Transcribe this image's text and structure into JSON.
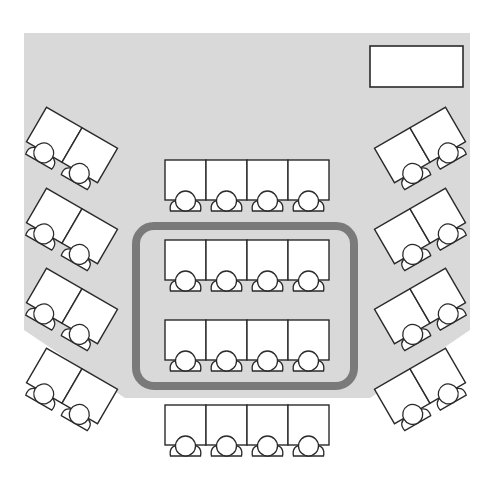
{
  "diagram": {
    "type": "classroom-seating-layout",
    "colors": {
      "room_fill": "#d9d9d9",
      "highlight_stroke": "#7a7a7a",
      "desk_fill": "#ffffff",
      "outline": "#2a2a2a"
    },
    "teacher_desk": {
      "x": 370,
      "y": 46,
      "w": 93,
      "h": 41
    },
    "highlight_group": {
      "x": 136,
      "y": 226,
      "w": 218,
      "h": 160,
      "rx": 18,
      "label": ""
    },
    "center_rows": [
      {
        "name": "row-1",
        "y": 160,
        "seats": 4,
        "highlighted": false
      },
      {
        "name": "row-2",
        "y": 240,
        "seats": 4,
        "highlighted": true
      },
      {
        "name": "row-3",
        "y": 320,
        "seats": 4,
        "highlighted": true
      },
      {
        "name": "row-4",
        "y": 405,
        "seats": 4,
        "highlighted": false
      }
    ],
    "left_pairs": [
      {
        "cx": 72,
        "cy": 145
      },
      {
        "cx": 72,
        "cy": 226
      },
      {
        "cx": 72,
        "cy": 306
      },
      {
        "cx": 72,
        "cy": 386
      }
    ],
    "right_pairs": [
      {
        "cx": 420,
        "cy": 145
      },
      {
        "cx": 420,
        "cy": 226
      },
      {
        "cx": 420,
        "cy": 306
      },
      {
        "cx": 420,
        "cy": 386
      }
    ],
    "desk_size": {
      "w": 41,
      "h": 40
    },
    "side_rotation_deg": 30,
    "total_seats": 32
  }
}
